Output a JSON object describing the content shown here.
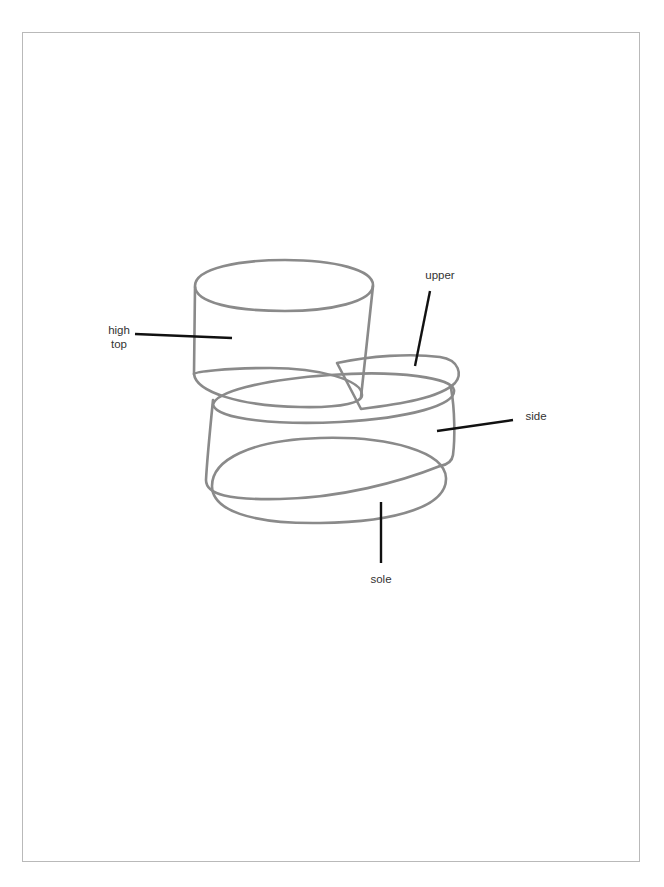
{
  "diagram": {
    "colors": {
      "outline": "#8a8a8a",
      "leader": "#111111",
      "label_text": "#333333",
      "frame": "#b9b9b9",
      "background": "#ffffff"
    },
    "labels": [
      {
        "id": "high-top",
        "text": "high\ntop",
        "x": 108,
        "y": 323
      },
      {
        "id": "upper",
        "text": "upper",
        "x": 424,
        "y": 269
      },
      {
        "id": "side",
        "text": "side",
        "x": 524,
        "y": 410
      },
      {
        "id": "sole",
        "text": "sole",
        "x": 370,
        "y": 573
      }
    ],
    "parts": [
      "high top",
      "upper",
      "side",
      "sole"
    ]
  }
}
